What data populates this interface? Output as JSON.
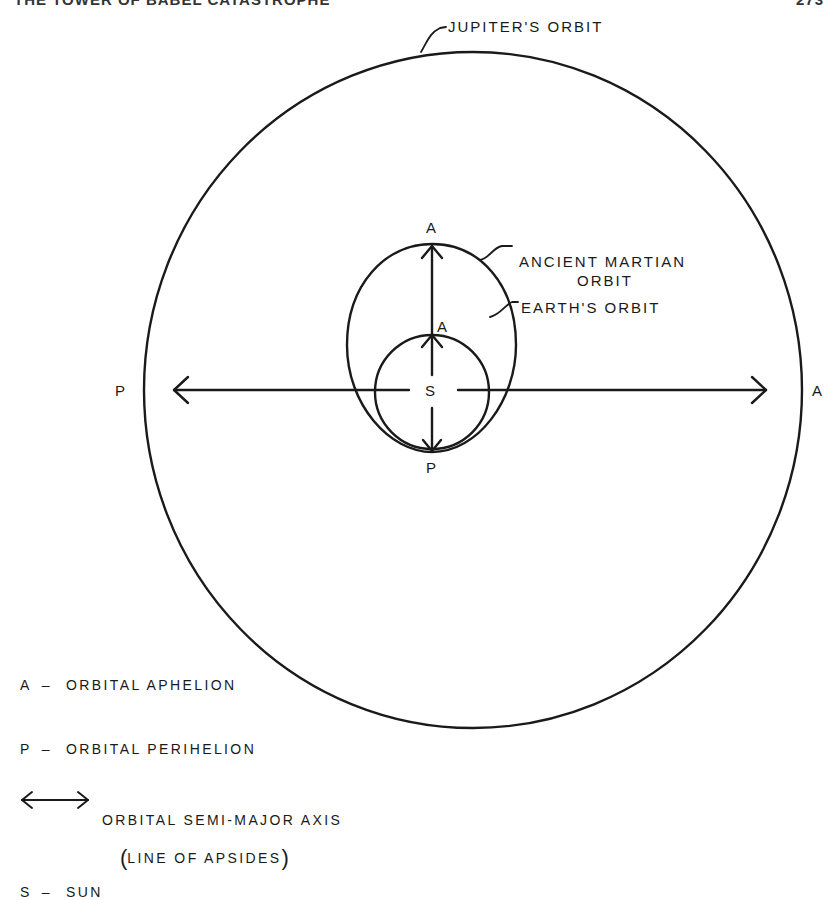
{
  "page_header": {
    "title": "THE TOWER OF BABEL CATASTROPHE",
    "page_number": "273"
  },
  "diagram": {
    "orbits": [
      {
        "name": "jupiter",
        "label": "JUPITER'S  ORBIT"
      },
      {
        "name": "ancient-martian",
        "label_line1": "ANCIENT  MARTIAN",
        "label_line2": "ORBIT"
      },
      {
        "name": "earth",
        "label": "EARTH'S  ORBIT"
      }
    ],
    "points": {
      "sun": "S",
      "jupiter_perihelion": "P",
      "jupiter_aphelion": "A",
      "mars_aphelion": "A",
      "earth_aphelion": "A",
      "perihelion_bottom": "P"
    },
    "stroke_color": "#1a1a1a",
    "background": "#ffffff"
  },
  "legend": {
    "items": [
      {
        "key": "A",
        "dash": "–",
        "text": "ORBITAL  APHELION"
      },
      {
        "key": "P",
        "dash": "–",
        "text": "ORBITAL  PERIHELION"
      },
      {
        "key": "double-arrow",
        "text": "ORBITAL  SEMI-MAJOR  AXIS",
        "subtext": "LINE  OF  APSIDES"
      },
      {
        "key": "S",
        "dash": "–",
        "text": "SUN"
      }
    ],
    "paren_open": "(",
    "paren_close": ")"
  }
}
